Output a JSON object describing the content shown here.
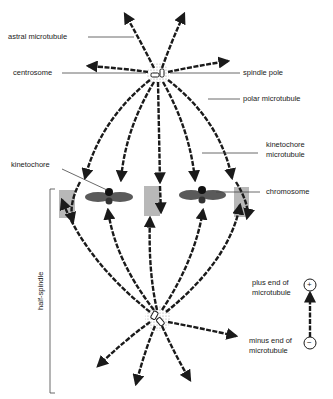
{
  "diagram": {
    "colors": {
      "microtubule": "#1a1a1a",
      "chromosome": "#5a5a5a",
      "chromosome_side": "#b8b8b8",
      "centrosome_halo": "#cfcfcf",
      "leader_line": "#444444"
    },
    "labels": {
      "astral_microtubule": "astral microtubule",
      "centrosome": "centrosome",
      "spindle_pole": "spindle pole",
      "polar_microtubule": "polar microtubule",
      "kinetochore_microtubule_1": "kinetochore",
      "kinetochore_microtubule_2": "microtubule",
      "kinetochore": "kinetochore",
      "chromosome": "chromosome",
      "half_spindle": "half-spindle",
      "plus_end_1": "plus end of",
      "plus_end_2": "microtubule",
      "minus_end_1": "minus end of",
      "minus_end_2": "microtubule",
      "plus_symbol": "+",
      "minus_symbol": "−"
    }
  }
}
